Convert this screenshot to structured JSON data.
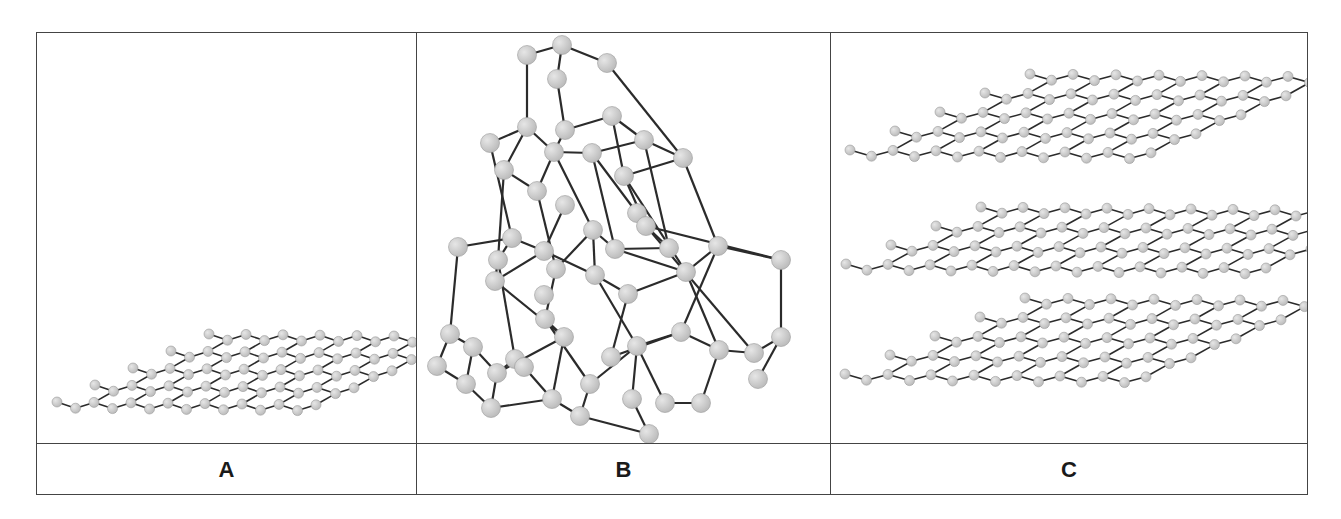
{
  "figure": {
    "panels": [
      {
        "id": "A",
        "label": "A",
        "structure": "single hexagonal carbon sheet (graphene)"
      },
      {
        "id": "B",
        "label": "B",
        "structure": "tetrahedral 3D carbon lattice (diamond)"
      },
      {
        "id": "C",
        "label": "C",
        "structure": "stacked hexagonal carbon sheets (graphite)"
      }
    ]
  },
  "colors": {
    "border": "#444444",
    "bond": "#2b2b2b",
    "atom_fill": "#bdbdbd",
    "atom_highlight": "#e6e6e6",
    "label_text": "#1a1a1a"
  },
  "sheets": {
    "A": [
      {
        "x0": 20,
        "y0": 371,
        "rows": 4,
        "cols": 7,
        "dx": 37,
        "rowdx": 38,
        "rowdy": -17,
        "r": 5
      }
    ],
    "C": [
      {
        "x0": 19,
        "y0": 119,
        "rows": 4,
        "cols": 7,
        "dx": 43,
        "rowdx": 45,
        "rowdy": -19,
        "r": 5
      },
      {
        "x0": 15,
        "y0": 233,
        "rows": 3,
        "cols": 10,
        "dx": 42,
        "rowdx": 45,
        "rowdy": -19,
        "r": 5
      },
      {
        "x0": 14,
        "y0": 343,
        "rows": 4,
        "cols": 7,
        "dx": 43,
        "rowdx": 45,
        "rowdy": -19,
        "r": 5
      }
    ]
  }
}
